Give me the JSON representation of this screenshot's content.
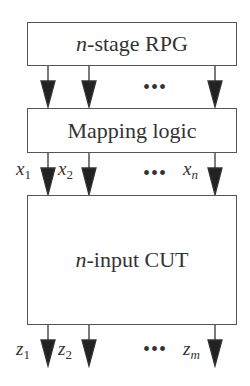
{
  "blocks": [
    {
      "id": "rpg",
      "label_prefix": "n",
      "label_rest": "-stage RPG"
    },
    {
      "id": "mapping",
      "label": "Mapping logic"
    },
    {
      "id": "cut",
      "label_prefix": "n",
      "label_rest": "-input CUT"
    }
  ],
  "inputs": {
    "labels": [
      "x",
      "x",
      "x"
    ],
    "subs": [
      "1",
      "2",
      "n"
    ],
    "ellipsis": "•••"
  },
  "outputs": {
    "labels": [
      "z",
      "z",
      "z"
    ],
    "subs": [
      "1",
      "2",
      "m"
    ],
    "ellipsis": "•••"
  },
  "rpg_ellipsis": "•••"
}
